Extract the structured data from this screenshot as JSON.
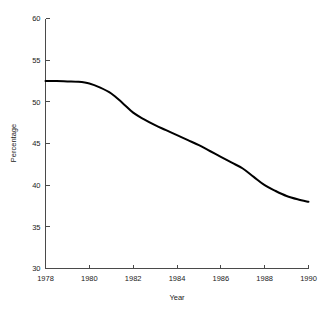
{
  "chart_data": {
    "type": "line",
    "title": "",
    "xlabel": "Year",
    "ylabel": "Percentage",
    "xlim": [
      1978,
      1990
    ],
    "ylim": [
      30,
      60
    ],
    "grid": false,
    "legend": null,
    "x_ticks": [
      1978,
      1980,
      1982,
      1984,
      1986,
      1988,
      1990
    ],
    "x_tick_labels": [
      "1978",
      "1980",
      "1982",
      "1984",
      "1986",
      "1988",
      "1990"
    ],
    "y_ticks": [
      30,
      35,
      40,
      45,
      50,
      55,
      60
    ],
    "y_tick_labels": [
      "30",
      "35",
      "40",
      "45",
      "50",
      "55",
      "60"
    ],
    "line_color": "#000000",
    "axis_color": "#4a4a4a",
    "background_color": "#ffffff",
    "series": [
      {
        "name": "Percentage",
        "x": [
          1978,
          1978.5,
          1979,
          1979.5,
          1980,
          1980.5,
          1981,
          1981.5,
          1982,
          1982.5,
          1983,
          1983.5,
          1984,
          1984.5,
          1985,
          1985.5,
          1986,
          1986.5,
          1987,
          1987.5,
          1988,
          1988.5,
          1989,
          1989.5,
          1990
        ],
        "values": [
          52.5,
          52.5,
          52.45,
          52.4,
          52.2,
          51.7,
          51.0,
          49.9,
          48.7,
          47.9,
          47.2,
          46.6,
          46.0,
          45.4,
          44.8,
          44.1,
          43.4,
          42.7,
          42.0,
          41.0,
          40.0,
          39.3,
          38.7,
          38.3,
          38.0
        ]
      }
    ]
  },
  "axis_titles": {
    "x": "Year",
    "y": "Percentage"
  }
}
